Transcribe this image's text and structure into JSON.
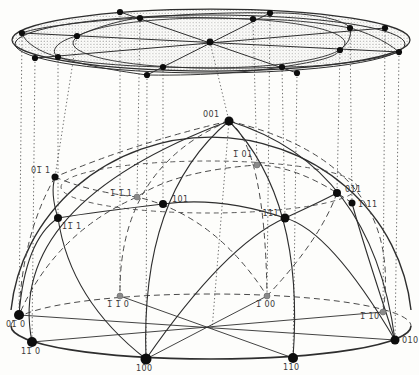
{
  "figure": {
    "colors": {
      "line": "#2e2e2e",
      "back_line": "#4a4a4a",
      "dotted_line": "#3c3c3c",
      "stipple": "#8f8f8f",
      "front_dot": "#0d0d0d",
      "back_dot": "#8a8a8a",
      "label": "#3a3a3a",
      "background": "#fdfdfb"
    },
    "sphere_points": [
      {
        "id": "001",
        "label": "001",
        "x": 229,
        "y": 121,
        "r": 4.5,
        "style": "front",
        "lx": 203,
        "ly": 117,
        "anchor": "start"
      },
      {
        "id": "-101",
        "label": "1̅ 01",
        "x": 257,
        "y": 165,
        "r": 3,
        "style": "back",
        "lx": 233,
        "ly": 157,
        "anchor": "start"
      },
      {
        "id": "0-11",
        "label": "01̅ 1",
        "x": 55,
        "y": 177,
        "r": 3.5,
        "style": "front",
        "lx": 31,
        "ly": 173,
        "anchor": "start"
      },
      {
        "id": "-1-11",
        "label": "1̅ 1̅ 1",
        "x": 137,
        "y": 197,
        "r": 3,
        "style": "back",
        "lx": 110,
        "ly": 196,
        "anchor": "start"
      },
      {
        "id": "101",
        "label": "101",
        "x": 163,
        "y": 204,
        "r": 4,
        "style": "front",
        "lx": 172,
        "ly": 202,
        "anchor": "start"
      },
      {
        "id": "111",
        "label": "111",
        "x": 285,
        "y": 218,
        "r": 4.5,
        "style": "front",
        "lx": 279,
        "ly": 216,
        "anchor": "end"
      },
      {
        "id": "011",
        "label": "011",
        "x": 337,
        "y": 193,
        "r": 4,
        "style": "front",
        "lx": 345,
        "ly": 192,
        "anchor": "start"
      },
      {
        "id": "-111",
        "label": "1̅ 11",
        "x": 352,
        "y": 203,
        "r": 3.5,
        "style": "front",
        "lx": 358,
        "ly": 207,
        "anchor": "start"
      },
      {
        "id": "1-11",
        "label": "11̅ 1",
        "x": 58,
        "y": 218,
        "r": 4,
        "style": "front",
        "lx": 62,
        "ly": 229,
        "anchor": "start"
      },
      {
        "id": "0-10",
        "label": "01̅ 0",
        "x": 19,
        "y": 315,
        "r": 5,
        "style": "front",
        "lx": 6,
        "ly": 327,
        "anchor": "start"
      },
      {
        "id": "1-10",
        "label": "11̅ 0",
        "x": 32,
        "y": 342,
        "r": 5,
        "style": "front",
        "lx": 21,
        "ly": 354,
        "anchor": "start"
      },
      {
        "id": "-1-10",
        "label": "1̅ 1̅ 0",
        "x": 120,
        "y": 296,
        "r": 3,
        "style": "back",
        "lx": 107,
        "ly": 307,
        "anchor": "start"
      },
      {
        "id": "100",
        "label": "100",
        "x": 146,
        "y": 359,
        "r": 5.5,
        "style": "front",
        "lx": 136,
        "ly": 371,
        "anchor": "start"
      },
      {
        "id": "110",
        "label": "110",
        "x": 293,
        "y": 358,
        "r": 5,
        "style": "front",
        "lx": 283,
        "ly": 370,
        "anchor": "start"
      },
      {
        "id": "010",
        "label": "010",
        "x": 395,
        "y": 340,
        "r": 4.5,
        "style": "front",
        "lx": 402,
        "ly": 343,
        "anchor": "start"
      },
      {
        "id": "-110",
        "label": "1̅ 10",
        "x": 383,
        "y": 312,
        "r": 3,
        "style": "back",
        "lx": 360,
        "ly": 319,
        "anchor": "start"
      },
      {
        "id": "-100",
        "label": "1̅ 00",
        "x": 267,
        "y": 296,
        "r": 3,
        "style": "back",
        "lx": 256,
        "ly": 307,
        "anchor": "start"
      }
    ],
    "disk_points": [
      {
        "id": "001",
        "x": 210,
        "y": 42
      },
      {
        "id": "100",
        "x": 147,
        "y": 75
      },
      {
        "id": "110",
        "x": 297,
        "y": 73
      },
      {
        "id": "010",
        "x": 399,
        "y": 52
      },
      {
        "id": "0-10",
        "x": 22,
        "y": 33
      },
      {
        "id": "1-10",
        "x": 35,
        "y": 58
      },
      {
        "id": "-110",
        "x": 385,
        "y": 28
      },
      {
        "id": "-1-10",
        "x": 120,
        "y": 12
      },
      {
        "id": "-100",
        "x": 270,
        "y": 13
      },
      {
        "id": "101",
        "x": 163,
        "y": 67
      },
      {
        "id": "011",
        "x": 340,
        "y": 50
      },
      {
        "id": "-101",
        "x": 253,
        "y": 19
      },
      {
        "id": "0-11",
        "x": 77,
        "y": 36
      },
      {
        "id": "111",
        "x": 282,
        "y": 67
      },
      {
        "id": "1-11",
        "x": 58,
        "y": 57
      },
      {
        "id": "-111",
        "x": 350,
        "y": 28
      },
      {
        "id": "-1-11",
        "x": 140,
        "y": 18
      }
    ],
    "disk": {
      "rims": [
        {
          "cx": 211,
          "cy": 40,
          "rx": 199,
          "ry": 31
        },
        {
          "cx": 210,
          "cy": 44,
          "rx": 195,
          "ry": 29
        }
      ],
      "ring45": {
        "cx": 209,
        "cy": 43,
        "rx": 136,
        "ry": 25
      },
      "diameters": [
        [
          "0-10",
          "010"
        ],
        [
          "100",
          "-100"
        ],
        [
          "1-10",
          "-110"
        ],
        [
          "110",
          "-1-10"
        ]
      ],
      "zone_arcs": [
        "M147,75 C210,76 255,71 282,67 C320,61 336,57 340,50 C348,44 352,36 350,28 C344,18 300,12 270,13",
        "M147,75 C110,70 75,63 58,57 C48,50 60,40 77,36 C95,28 120,20 140,18 C180,14 240,12 270,13",
        "M399,52 C370,62 320,67 282,67 C240,69 200,68 163,67 C120,66 75,62 58,57 C40,52 25,43 22,33",
        "M399,52 C385,40 365,32 350,28 C320,22 280,19 253,19 C210,18 165,16 140,18 C100,20 40,26 22,33"
      ]
    },
    "sphere": {
      "limb": "M 11 310 A 201 192 0 0 1 411 310",
      "equator_front": "M 11 326 C 11 345 100 359 211 359 C 322 359 411 345 411 326",
      "equator_back": "M 11 326 C 11 308 100 294 211 294 C 322 294 411 308 411 326",
      "base_diameters": [
        [
          19,
          315,
          395,
          340
        ],
        [
          146,
          359,
          267,
          296
        ],
        [
          32,
          342,
          383,
          312
        ],
        [
          293,
          358,
          120,
          296
        ]
      ],
      "front_arcs": [
        "M146,359 Q140,195 229,121",
        "M395,340 Q372,165 229,121",
        "M293,358 Q305,200 229,121",
        "M32,342 Q5,205 229,121",
        "M146,359 Q225,245 285,218 Q320,202 337,193",
        "M395,340 Q330,230 285,218 Q220,196 163,204 Q95,212 58,218 Q25,240 19,315",
        "M146,359 Q70,300 58,218 Q50,193 55,177",
        "M395,340 Q362,240 352,203"
      ],
      "back_arcs": [
        "M229,121 Q265,148 267,296",
        "M229,121 Q135,143 55,177",
        "M55,177 Q22,235 19,315",
        "M229,121 Q118,168 120,296",
        "M229,121 Q405,163 383,312",
        "M337,193 Q320,240 267,296",
        "M55,177 Q90,192 137,197 Q215,215 267,296",
        "M352,203 Q300,166 257,165 Q175,171 137,197 Q55,233 19,315"
      ],
      "lat_ring": {
        "cx": 209,
        "cy": 187,
        "rx": 148,
        "ry": 26
      },
      "axis_dotted": [
        229,
        121,
        212,
        330
      ]
    }
  }
}
